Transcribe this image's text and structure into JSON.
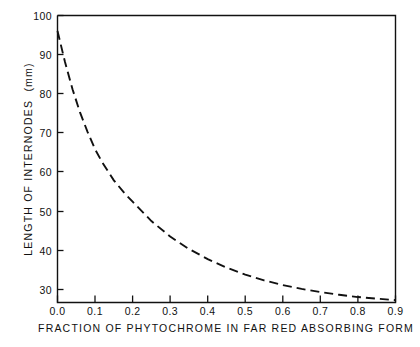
{
  "figure": {
    "background_color": "#ffffff",
    "ink_color": "#111111"
  },
  "chart_data": {
    "type": "line",
    "title": "",
    "subtitle": "",
    "xlabel": "FRACTION OF PHYTOCHROME IN FAR RED ABSORBING FORM",
    "ylabel": "LENGTH OF INTERNODES  (mm)",
    "xlim": [
      0.0,
      0.9
    ],
    "ylim": [
      26.0,
      100.0
    ],
    "grid": false,
    "legend": "none",
    "line_style": "dashed",
    "line_color": "#111111",
    "marker": "none",
    "xticks": [
      0.0,
      0.1,
      0.2,
      0.3,
      0.4,
      0.5,
      0.6,
      0.7,
      0.8,
      0.9
    ],
    "xtick_labels": [
      "0.0",
      "0.1",
      "0.2",
      "0.3",
      "0.4",
      "0.5",
      "0.6",
      "0.7",
      "0.8",
      "0.9"
    ],
    "yticks": [
      30,
      40,
      50,
      60,
      70,
      80,
      90,
      100
    ],
    "ytick_labels": [
      "30",
      "40",
      "50",
      "60",
      "70",
      "80",
      "90",
      "100"
    ],
    "x": [
      0.0,
      0.02,
      0.04,
      0.06,
      0.08,
      0.1,
      0.12,
      0.15,
      0.18,
      0.2,
      0.25,
      0.3,
      0.35,
      0.4,
      0.45,
      0.5,
      0.55,
      0.6,
      0.65,
      0.7,
      0.75,
      0.8,
      0.85,
      0.9
    ],
    "y": [
      96.0,
      88.0,
      81.0,
      75.0,
      70.0,
      65.5,
      62.0,
      57.5,
      54.0,
      52.0,
      47.0,
      43.0,
      39.8,
      37.2,
      35.0,
      33.2,
      31.7,
      30.5,
      29.5,
      28.7,
      28.0,
      27.4,
      27.0,
      26.6
    ],
    "series": [
      {
        "name": "internode length",
        "values": [
          96.0,
          88.0,
          81.0,
          75.0,
          70.0,
          65.5,
          62.0,
          57.5,
          54.0,
          52.0,
          47.0,
          43.0,
          39.8,
          37.2,
          35.0,
          33.2,
          31.7,
          30.5,
          29.5,
          28.7,
          28.0,
          27.4,
          27.0,
          26.6
        ]
      }
    ]
  }
}
